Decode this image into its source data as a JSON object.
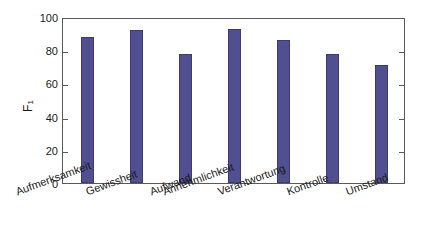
{
  "chart_data": {
    "type": "bar",
    "title": "",
    "xlabel": "",
    "ylabel": "F",
    "ylabel_sub": "1",
    "categories": [
      "Aufmerksamkeit",
      "Gewissheit",
      "Aufwand",
      "Annehmlichkeit",
      "Verantwortung",
      "Kontrolle",
      "Umstand"
    ],
    "values": [
      88,
      92,
      78,
      93,
      86,
      78,
      71
    ],
    "ylim": [
      0,
      100
    ],
    "yticks": [
      0,
      20,
      40,
      60,
      80,
      100
    ],
    "ytick_labels": [
      "0",
      "20",
      "40",
      "60",
      "80",
      "100"
    ],
    "grid": false,
    "legend": null,
    "bar_color": "#4f4f91",
    "bar_edge_color": "#3c3c72",
    "axis_color": "#5a5a5a",
    "background": "#ffffff"
  }
}
